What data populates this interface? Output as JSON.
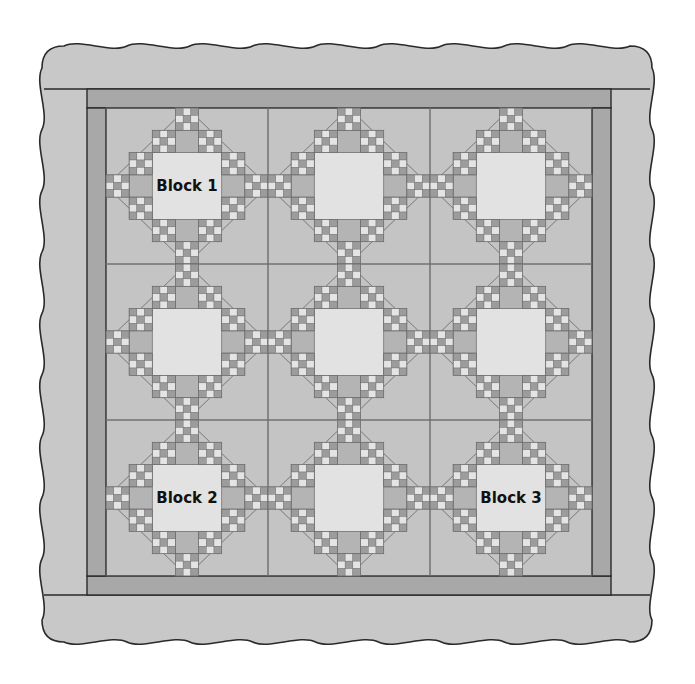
{
  "diagram": {
    "type": "quilt-layout",
    "grid": {
      "rows": 3,
      "cols": 3,
      "units_per_block": 7
    },
    "labels": [
      {
        "text": "Block 1",
        "row": 0,
        "col": 0
      },
      {
        "text": "Block 2",
        "row": 2,
        "col": 0
      },
      {
        "text": "Block 3",
        "row": 2,
        "col": 2
      }
    ],
    "colors": {
      "background": "#ffffff",
      "outer_border": "#c8c8c8",
      "inner_border": "#a8a8a8",
      "body": "#c4c4c4",
      "patch_dark": "#9c9c9c",
      "patch_light": "#e4e4e4",
      "center_square": "#e2e2e2",
      "plain_unit": "#b4b4b4",
      "outline": "#2a2a2a",
      "seam": "#6e6e6e"
    },
    "geometry": {
      "outer": {
        "x1": 42,
        "y1": 46,
        "x2": 652,
        "y2": 642
      },
      "inner_border": {
        "x1": 87,
        "y1": 89,
        "x2": 611,
        "y2": 595,
        "width": 19
      },
      "body": {
        "x1": 106,
        "y1": 108,
        "x2": 592,
        "y2": 576
      },
      "scallop": {
        "period": 60,
        "amplitude": 6
      }
    }
  }
}
